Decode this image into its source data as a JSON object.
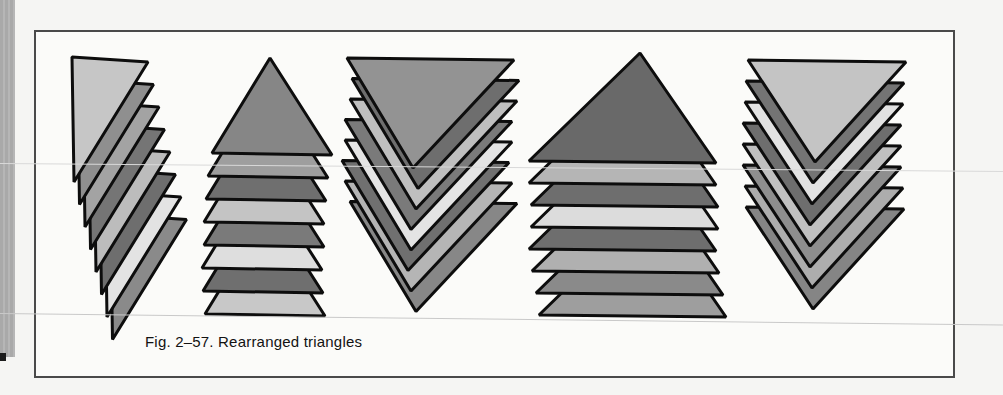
{
  "page": {
    "background_color": "#f5f5f3",
    "gutter_bar_color": "#a9a9a9",
    "gutter_bar_stripe_color": "#b6b6b6",
    "registration_mark_color": "#1c1c1c"
  },
  "figure": {
    "caption": "Fig. 2–57. Rearranged triangles",
    "caption_color": "#121212",
    "box": {
      "left": 34,
      "top": 30,
      "width": 921,
      "height": 348,
      "border_color": "#4a4a4a",
      "fill": "#fbfbf9"
    },
    "stroke_color": "#0d0d0d",
    "stroke_width": 3,
    "groups": [
      {
        "name": "diagonal-cascade",
        "layers": 8,
        "base_points": [
          [
            72,
            57
          ],
          [
            148,
            62
          ],
          [
            74,
            182
          ]
        ],
        "step": [
          5.5,
          22.5
        ],
        "jitter_x": [
          0,
          0,
          0,
          0,
          0,
          0,
          0,
          0
        ],
        "colors": [
          "#c6c6c6",
          "#8f8f8f",
          "#a3a3a3",
          "#757575",
          "#bcbcbc",
          "#6e6e6e",
          "#e3e3e3",
          "#8a8a8a"
        ]
      },
      {
        "name": "upright-stack-narrow",
        "layers": 8,
        "base_points": [
          [
            270,
            58
          ],
          [
            332,
            155
          ],
          [
            212,
            153
          ]
        ],
        "step": [
          0,
          23
        ],
        "jitter_x": [
          0,
          -4,
          -6,
          -8,
          -8,
          -10,
          -9,
          -7
        ],
        "colors": [
          "#868686",
          "#9e9e9e",
          "#6f6f6f",
          "#c4c4c4",
          "#7a7a7a",
          "#dedede",
          "#6f6f6f",
          "#c8c8c8"
        ]
      },
      {
        "name": "inverted-cascade-left",
        "layers": 8,
        "base_points": [
          [
            347,
            58
          ],
          [
            514,
            60
          ],
          [
            413,
            168
          ]
        ],
        "step": [
          0,
          20.5
        ],
        "jitter_x": [
          0,
          5,
          3,
          -2,
          -2,
          -5,
          -2,
          3
        ],
        "colors": [
          "#939393",
          "#6e6e6e",
          "#bfbfbf",
          "#7a7a7a",
          "#e4e4e4",
          "#707070",
          "#b5b5b5",
          "#878787"
        ]
      },
      {
        "name": "upright-stack-wide",
        "layers": 8,
        "base_points": [
          [
            640,
            53
          ],
          [
            716,
            163
          ],
          [
            529,
            161
          ]
        ],
        "step": [
          0,
          22
        ],
        "jitter_x": [
          0,
          0,
          2,
          2,
          0,
          3,
          7,
          10
        ],
        "colors": [
          "#696969",
          "#b5b5b5",
          "#6e6e6e",
          "#dcdcdc",
          "#6e6e6e",
          "#b0b0b0",
          "#8a8a8a",
          "#9e9e9e"
        ]
      },
      {
        "name": "inverted-cascade-right",
        "layers": 8,
        "base_points": [
          [
            748,
            60
          ],
          [
            906,
            62
          ],
          [
            815,
            162
          ]
        ],
        "step": [
          0,
          21
        ],
        "jitter_x": [
          0,
          -2,
          -3,
          -5,
          -5,
          -5,
          -3,
          -2
        ],
        "colors": [
          "#c4c4c4",
          "#747474",
          "#e2e2e2",
          "#6e6e6e",
          "#c0c0c0",
          "#8e8e8e",
          "#adadad",
          "#858585"
        ]
      }
    ],
    "scan_lines": [
      {
        "y": 163,
        "tilt_deg": 0.45,
        "color": "#d9d9d9"
      },
      {
        "y": 313,
        "tilt_deg": 0.65,
        "color": "#c9c9c9"
      }
    ]
  }
}
